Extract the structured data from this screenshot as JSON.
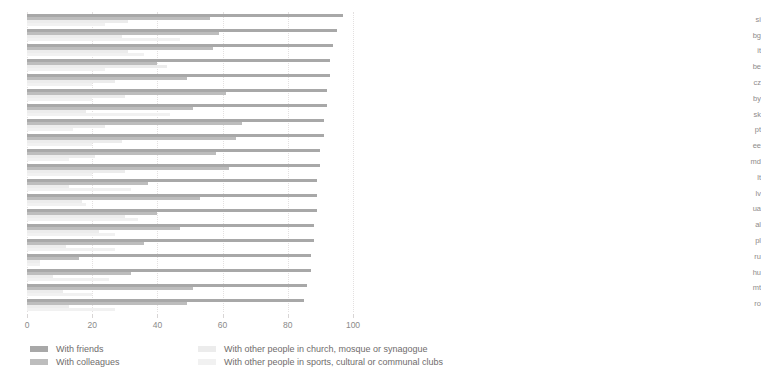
{
  "chart_data": {
    "type": "bar",
    "orientation": "horizontal",
    "title": "",
    "xlabel": "",
    "ylabel": "",
    "xlim": [
      0,
      100
    ],
    "xticks": [
      0,
      20,
      40,
      60,
      80,
      100
    ],
    "grid": true,
    "legend_position": "bottom",
    "series": [
      {
        "name": "With friends",
        "color": "#a8a8a8"
      },
      {
        "name": "With colleagues",
        "color": "#bdbdbd"
      },
      {
        "name": "With other people in church, mosque or synagogue",
        "color": "#ececec"
      },
      {
        "name": "With other people in sports, cultural or communal clubs",
        "color": "#f1f1f1"
      }
    ],
    "panels": [
      {
        "name": "left-panel",
        "categories": [
          "ba",
          "se",
          "ie",
          "nir",
          "gb",
          "gr",
          "nl",
          "mon",
          "ser",
          "tr",
          "mk",
          "dk",
          "hr",
          "is",
          "fi",
          "at",
          "lu",
          "fr",
          "es",
          "de"
        ],
        "values": {
          "With friends": [
            97,
            95,
            94,
            93,
            93,
            92,
            92,
            91,
            91,
            90,
            90,
            89,
            89,
            89,
            88,
            88,
            87,
            87,
            86,
            85
          ],
          "With colleagues": [
            56,
            59,
            57,
            40,
            49,
            61,
            51,
            66,
            64,
            58,
            62,
            37,
            53,
            40,
            47,
            36,
            16,
            32,
            51,
            49
          ],
          "With other people in church, mosque or synagogue": [
            31,
            29,
            31,
            43,
            27,
            30,
            18,
            24,
            29,
            21,
            30,
            13,
            17,
            30,
            22,
            12,
            4,
            8,
            11,
            13
          ],
          "With other people in sports, cultural or communal clubs": [
            24,
            47,
            36,
            24,
            20,
            20,
            44,
            14,
            20,
            13,
            20,
            32,
            18,
            34,
            27,
            27,
            4,
            25,
            20,
            27
          ]
        }
      },
      {
        "name": "right-panel",
        "categories": [
          "si",
          "bg",
          "it",
          "be",
          "cz",
          "by",
          "sk",
          "pt",
          "ee",
          "md",
          "lt",
          "lv",
          "ua",
          "al",
          "pl",
          "ru",
          "hu",
          "mt",
          "ro"
        ],
        "values": {
          "With friends": [
            83,
            82,
            82,
            81,
            80,
            77,
            77,
            76,
            76,
            74,
            74,
            73,
            71,
            70,
            68,
            67,
            63,
            62,
            61
          ],
          "With colleagues": [
            50,
            58,
            45,
            38,
            41,
            41,
            28,
            53,
            42,
            49,
            39,
            35,
            44,
            57,
            35,
            40,
            25,
            19,
            53
          ],
          "With other people in church, mosque or synagogue": [
            22,
            25,
            19,
            25,
            12,
            14,
            25,
            25,
            21,
            30,
            24,
            16,
            19,
            21,
            22,
            11,
            7,
            9,
            26
          ],
          "With other people in sports, cultural or communal clubs": [
            34,
            20,
            29,
            55,
            21,
            14,
            15,
            35,
            32,
            18,
            29,
            22,
            24,
            20,
            18,
            18,
            10,
            38,
            13
          ]
        }
      }
    ]
  },
  "legend": {
    "items": [
      {
        "label": "With friends",
        "color": "#a8a8a8"
      },
      {
        "label": "With colleagues",
        "color": "#bdbdbd"
      },
      {
        "label": "With other people in church, mosque or synagogue",
        "color": "#ececec"
      },
      {
        "label": "With other people in sports, cultural or communal clubs",
        "color": "#f1f1f1"
      }
    ]
  }
}
